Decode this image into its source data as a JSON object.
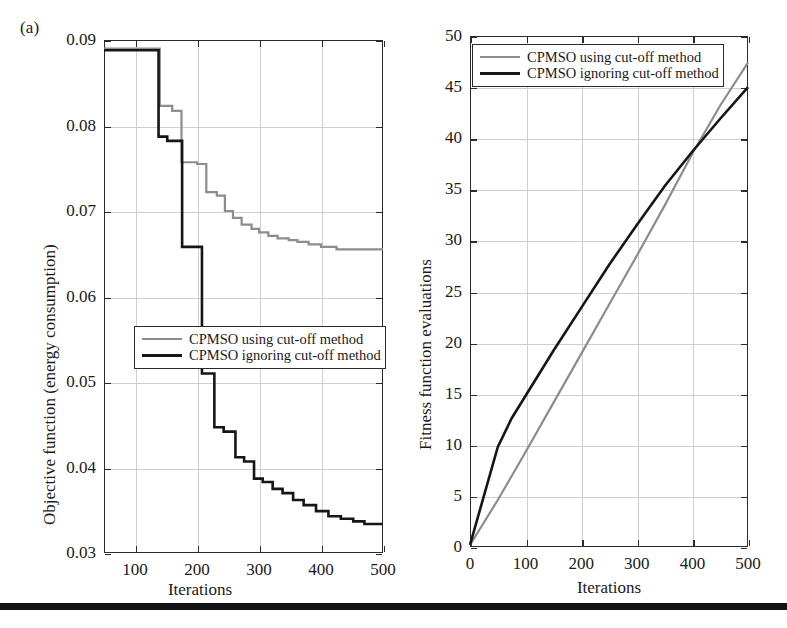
{
  "figure": {
    "panel_label": "(a)",
    "bottom_rule_color": "#121212"
  },
  "colors": {
    "series_gray": "#8c8c8c",
    "series_black": "#161616",
    "grid": "#cfcfcf",
    "axis": "#2b2b2b"
  },
  "legend": {
    "entries": [
      {
        "label": "CPMSO using cut-off method",
        "color": "#8c8c8c",
        "width": 2.6
      },
      {
        "label": "CPMSO ignoring cut-off method",
        "color": "#161616",
        "width": 3.2
      }
    ]
  },
  "chart_data": [
    {
      "id": "objective-function-chart",
      "type": "line",
      "title": "",
      "xlabel": "Iterations",
      "ylabel": "Objective function (energy consumption)",
      "xlim": [
        50,
        500
      ],
      "ylim": [
        0.03,
        0.09
      ],
      "xticks": [
        100,
        200,
        300,
        400,
        500
      ],
      "yticks": [
        0.03,
        0.04,
        0.05,
        0.06,
        0.07,
        0.08,
        0.09
      ],
      "xticklabels": [
        "100",
        "200",
        "300",
        "400",
        "500"
      ],
      "yticklabels": [
        "0.03",
        "0.04",
        "0.05",
        "0.06",
        "0.07",
        "0.08",
        "0.09"
      ],
      "grid": true,
      "legend_position": "lower-center",
      "step": "post",
      "series": [
        {
          "name": "CPMSO using cut-off method",
          "color": "#8c8c8c",
          "x": [
            50,
            140,
            140,
            160,
            160,
            175,
            175,
            200,
            200,
            215,
            215,
            232,
            232,
            245,
            245,
            258,
            258,
            272,
            272,
            288,
            288,
            300,
            300,
            315,
            315,
            330,
            330,
            348,
            348,
            362,
            362,
            380,
            380,
            400,
            400,
            425,
            425,
            500
          ],
          "y": [
            0.089,
            0.089,
            0.0823,
            0.0823,
            0.0817,
            0.0817,
            0.0757,
            0.0757,
            0.0755,
            0.0755,
            0.0722,
            0.0722,
            0.0718,
            0.0718,
            0.07,
            0.07,
            0.0692,
            0.0692,
            0.0684,
            0.0684,
            0.0679,
            0.0679,
            0.0675,
            0.0675,
            0.0671,
            0.0671,
            0.0668,
            0.0668,
            0.0666,
            0.0666,
            0.0664,
            0.0664,
            0.0661,
            0.0661,
            0.0658,
            0.0658,
            0.0655,
            0.0655
          ]
        },
        {
          "name": "CPMSO ignoring cut-off method",
          "color": "#161616",
          "x": [
            50,
            138,
            138,
            152,
            152,
            176,
            176,
            208,
            208,
            228,
            228,
            243,
            243,
            262,
            262,
            276,
            276,
            292,
            292,
            306,
            306,
            322,
            322,
            338,
            338,
            355,
            355,
            372,
            372,
            392,
            392,
            412,
            412,
            432,
            432,
            452,
            452,
            470,
            470,
            500
          ],
          "y": [
            0.0888,
            0.0888,
            0.0787,
            0.0787,
            0.0782,
            0.0782,
            0.0658,
            0.0658,
            0.051,
            0.051,
            0.0447,
            0.0447,
            0.0442,
            0.0442,
            0.0412,
            0.0412,
            0.0407,
            0.0407,
            0.0387,
            0.0387,
            0.0383,
            0.0383,
            0.0375,
            0.0375,
            0.037,
            0.037,
            0.0362,
            0.0362,
            0.0356,
            0.0356,
            0.0349,
            0.0349,
            0.0343,
            0.0343,
            0.034,
            0.034,
            0.0337,
            0.0337,
            0.0334,
            0.0334
          ]
        }
      ]
    },
    {
      "id": "fitness-evaluations-chart",
      "type": "line",
      "title": "",
      "xlabel": "Iterations",
      "ylabel": "Fitness function evaluations",
      "xlim": [
        0,
        500
      ],
      "ylim": [
        0,
        50
      ],
      "xticks": [
        0,
        100,
        200,
        300,
        400,
        500
      ],
      "yticks": [
        0,
        5,
        10,
        15,
        20,
        25,
        30,
        35,
        40,
        45,
        50
      ],
      "xticklabels": [
        "0",
        "100",
        "200",
        "300",
        "400",
        "500"
      ],
      "yticklabels": [
        "0",
        "5",
        "10",
        "15",
        "20",
        "25",
        "30",
        "35",
        "40",
        "45",
        "50"
      ],
      "grid": true,
      "legend_position": "upper-left",
      "step": "none",
      "series": [
        {
          "name": "CPMSO using cut-off method",
          "color": "#8c8c8c",
          "x": [
            0,
            50,
            100,
            150,
            200,
            250,
            300,
            350,
            400,
            450,
            500
          ],
          "y": [
            0.2,
            4.6,
            9.3,
            14.1,
            18.9,
            23.7,
            28.5,
            33.4,
            38.5,
            43.2,
            47.4
          ]
        },
        {
          "name": "CPMSO ignoring cut-off method",
          "color": "#161616",
          "x": [
            0,
            25,
            50,
            75,
            100,
            150,
            200,
            250,
            300,
            350,
            400,
            450,
            500
          ],
          "y": [
            0.2,
            5.0,
            9.8,
            12.6,
            14.8,
            19.2,
            23.4,
            27.6,
            31.5,
            35.3,
            38.7,
            41.9,
            45.0
          ]
        }
      ]
    }
  ]
}
